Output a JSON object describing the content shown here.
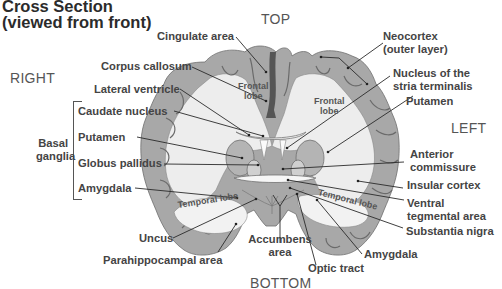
{
  "title": {
    "line1": "Cross Section",
    "line2": "(viewed from front)"
  },
  "orientation": {
    "top": "TOP",
    "bottom": "BOTTOM",
    "right": "RIGHT",
    "left": "LEFT"
  },
  "group": {
    "label_line1": "Basal",
    "label_line2": "ganglia"
  },
  "left_labels": {
    "cingulate": "Cingulate area",
    "corpus": "Corpus callosum",
    "lateral": "Lateral ventricle",
    "caudate": "Caudate nucleus",
    "putamen": "Putamen",
    "globus": "Globus pallidus",
    "amygdala": "Amygdala",
    "uncus": "Uncus",
    "parahippo": "Parahippocampal area"
  },
  "right_labels": {
    "neocortex_1": "Neocortex",
    "neocortex_2": "(outer layer)",
    "nucleus_1": "Nucleus of the",
    "nucleus_2": "stria terminalis",
    "putamen": "Putamen",
    "anterior_1": "Anterior",
    "anterior_2": "commissure",
    "insular": "Insular cortex",
    "ventral_1": "Ventral",
    "ventral_2": "tegmental area",
    "substantia": "Substantia nigra",
    "amygdala": "Amygdala",
    "optic": "Optic tract"
  },
  "bottom_labels": {
    "accumbens_1": "Accumbens",
    "accumbens_2": "area"
  },
  "inner_labels": {
    "frontal_left_1": "Frontal",
    "frontal_left_2": "lobe",
    "frontal_right_1": "Frontal",
    "frontal_right_2": "lobe",
    "temporal_left": "Temporal lobe",
    "temporal_right": "Temporal lobe"
  },
  "colors": {
    "gray_matter": "#a9a9a9",
    "white_matter": "#ececec",
    "line": "#333333",
    "dark": "#5a5a5a"
  }
}
